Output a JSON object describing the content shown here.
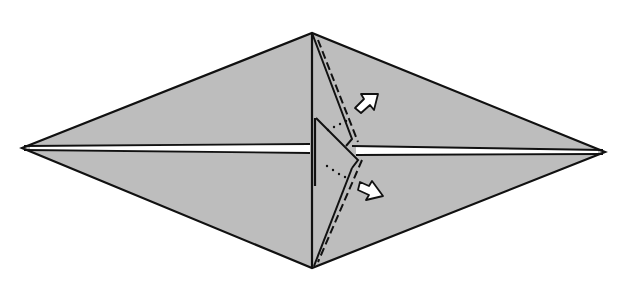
{
  "diagram": {
    "type": "origami-step",
    "colors": {
      "background": "#ffffff",
      "paper": "#bdbdbd",
      "line": "#111111",
      "crease_gap": "#ffffff",
      "arrow_fill": "#ffffff"
    },
    "shape": {
      "left_point": [
        22,
        148
      ],
      "top_point": [
        312,
        33
      ],
      "right_point": [
        605,
        152
      ],
      "bottom_point": [
        312,
        268
      ]
    },
    "center_crease": {
      "left": [
        22,
        148
      ],
      "right": [
        605,
        152
      ]
    },
    "flap": {
      "vertical_edge_top": [
        312,
        33
      ],
      "vertical_edge_bottom": [
        312,
        268
      ],
      "upper_diagonal": [
        [
          312,
          33
        ],
        [
          352,
          140
        ]
      ],
      "inner_triangle": [
        [
          316,
          118
        ],
        [
          316,
          188
        ],
        [
          358,
          158
        ]
      ]
    },
    "valley_folds": [
      {
        "from": [
          318,
          40
        ],
        "to": [
          356,
          140
        ]
      },
      {
        "from": [
          358,
          160
        ],
        "to": [
          318,
          262
        ]
      }
    ],
    "arrows": [
      {
        "name": "upper-arrow",
        "at": [
          370,
          98
        ],
        "direction": "up-right"
      },
      {
        "name": "lower-arrow",
        "at": [
          374,
          190
        ],
        "direction": "down-right"
      }
    ],
    "motion_dots": [
      {
        "from": [
          326,
          132
        ],
        "to": [
          344,
          122
        ]
      },
      {
        "from": [
          326,
          166
        ],
        "to": [
          352,
          178
        ]
      }
    ]
  }
}
